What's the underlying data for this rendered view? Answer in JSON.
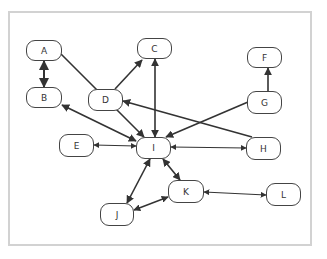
{
  "diagram": {
    "nodes": [
      {
        "id": "A",
        "label": "A",
        "x": 26,
        "y": 40,
        "w": 36,
        "h": 21
      },
      {
        "id": "B",
        "label": "B",
        "x": 26,
        "y": 87,
        "w": 36,
        "h": 21
      },
      {
        "id": "C",
        "label": "C",
        "x": 137,
        "y": 38,
        "w": 35,
        "h": 21
      },
      {
        "id": "D",
        "label": "D",
        "x": 88,
        "y": 89,
        "w": 35,
        "h": 22
      },
      {
        "id": "E",
        "label": "E",
        "x": 59,
        "y": 134,
        "w": 35,
        "h": 23
      },
      {
        "id": "F",
        "label": "F",
        "x": 247,
        "y": 47,
        "w": 35,
        "h": 21
      },
      {
        "id": "G",
        "label": "G",
        "x": 247,
        "y": 91,
        "w": 35,
        "h": 23
      },
      {
        "id": "H",
        "label": "H",
        "x": 246,
        "y": 137,
        "w": 35,
        "h": 23
      },
      {
        "id": "I",
        "label": "I",
        "x": 136,
        "y": 137,
        "w": 35,
        "h": 22
      },
      {
        "id": "J",
        "label": "J",
        "x": 100,
        "y": 203,
        "w": 34,
        "h": 23
      },
      {
        "id": "K",
        "label": "K",
        "x": 168,
        "y": 180,
        "w": 36,
        "h": 23
      },
      {
        "id": "L",
        "label": "L",
        "x": 266,
        "y": 183,
        "w": 35,
        "h": 23
      }
    ],
    "edges": [
      {
        "from": "A",
        "to": "B",
        "x1": 44,
        "y1": 61,
        "x2": 44,
        "y2": 87,
        "start_arrow": true,
        "end_arrow": true,
        "width": 2
      },
      {
        "from": "A",
        "to": "I",
        "x1": 61,
        "y1": 54,
        "x2": 144,
        "y2": 137,
        "start_arrow": false,
        "end_arrow": true,
        "width": 1.6
      },
      {
        "from": "B",
        "to": "I",
        "x1": 62,
        "y1": 105,
        "x2": 136,
        "y2": 141,
        "start_arrow": true,
        "end_arrow": true,
        "width": 1.6
      },
      {
        "from": "D",
        "to": "C",
        "x1": 115,
        "y1": 89,
        "x2": 142,
        "y2": 60,
        "start_arrow": false,
        "end_arrow": true,
        "width": 1.6
      },
      {
        "from": "C",
        "to": "I",
        "x1": 155,
        "y1": 59,
        "x2": 155,
        "y2": 137,
        "start_arrow": true,
        "end_arrow": true,
        "width": 1.6
      },
      {
        "from": "G",
        "to": "F",
        "x1": 268,
        "y1": 91,
        "x2": 268,
        "y2": 68,
        "start_arrow": false,
        "end_arrow": true,
        "width": 1.6
      },
      {
        "from": "G",
        "to": "I",
        "x1": 248,
        "y1": 102,
        "x2": 166,
        "y2": 137,
        "start_arrow": false,
        "end_arrow": true,
        "width": 1.6
      },
      {
        "from": "H",
        "to": "D",
        "x1": 252,
        "y1": 137,
        "x2": 123,
        "y2": 101,
        "start_arrow": false,
        "end_arrow": true,
        "width": 1.6
      },
      {
        "from": "E",
        "to": "I",
        "x1": 94,
        "y1": 145,
        "x2": 136,
        "y2": 146,
        "start_arrow": true,
        "end_arrow": true,
        "width": 1.2
      },
      {
        "from": "I",
        "to": "H",
        "x1": 171,
        "y1": 147,
        "x2": 246,
        "y2": 148,
        "start_arrow": true,
        "end_arrow": true,
        "width": 1.2
      },
      {
        "from": "I",
        "to": "J",
        "x1": 150,
        "y1": 159,
        "x2": 127,
        "y2": 203,
        "start_arrow": true,
        "end_arrow": true,
        "width": 1.6
      },
      {
        "from": "I",
        "to": "K",
        "x1": 163,
        "y1": 159,
        "x2": 180,
        "y2": 180,
        "start_arrow": true,
        "end_arrow": true,
        "width": 1.6
      },
      {
        "from": "J",
        "to": "K",
        "x1": 134,
        "y1": 210,
        "x2": 168,
        "y2": 197,
        "start_arrow": true,
        "end_arrow": true,
        "width": 1.4
      },
      {
        "from": "K",
        "to": "L",
        "x1": 204,
        "y1": 192,
        "x2": 266,
        "y2": 195,
        "start_arrow": true,
        "end_arrow": true,
        "width": 1.2
      }
    ],
    "colors": {
      "edge": "#333333",
      "node_border": "#444444",
      "frame_border": "#d2d2d2"
    }
  }
}
